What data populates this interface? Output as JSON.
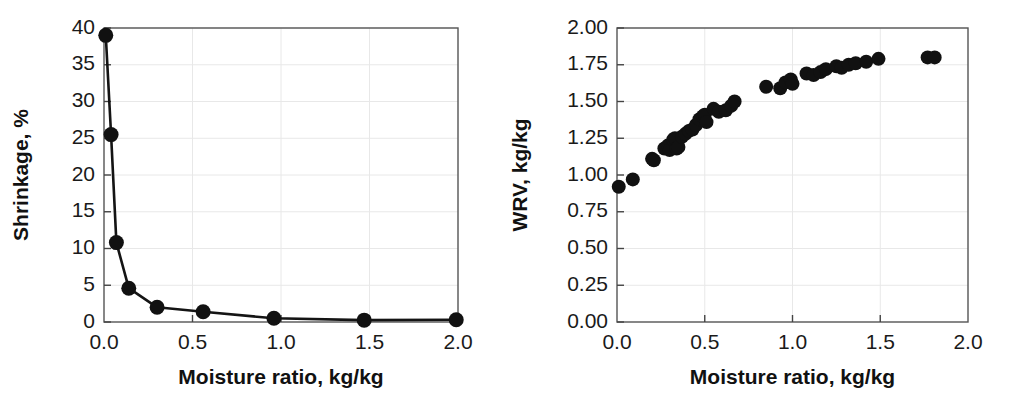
{
  "figure": {
    "panels": [
      "shrinkage-panel",
      "wrv-panel"
    ],
    "background": "#ffffff",
    "marker_color": "#111111",
    "line_color": "#141414",
    "grid_color": "#e8e8e8",
    "frame_color": "#555555"
  },
  "chart_data": [
    {
      "id": "shrinkage-panel",
      "type": "line",
      "title": "",
      "xlabel": "Moisture ratio, kg/kg",
      "ylabel": "Shrinkage, %",
      "xlim": [
        0.0,
        2.0
      ],
      "ylim": [
        0,
        40
      ],
      "xticks": [
        0.0,
        0.5,
        1.0,
        1.5,
        2.0
      ],
      "xtick_labels": [
        "0.0",
        "0.5",
        "1.0",
        "1.5",
        "2.0"
      ],
      "yticks": [
        0,
        5,
        10,
        15,
        20,
        25,
        30,
        35,
        40
      ],
      "ytick_labels": [
        "0",
        "5",
        "10",
        "15",
        "20",
        "25",
        "30",
        "35",
        "40"
      ],
      "grid": true,
      "legend": "none",
      "markers": "filled-circle",
      "x": [
        0.01,
        0.04,
        0.07,
        0.14,
        0.3,
        0.56,
        0.96,
        1.47,
        1.99
      ],
      "y": [
        39.0,
        25.5,
        10.8,
        4.6,
        2.0,
        1.4,
        0.5,
        0.25,
        0.3
      ]
    },
    {
      "id": "wrv-panel",
      "type": "scatter",
      "title": "",
      "xlabel": "Moisture ratio, kg/kg",
      "ylabel": "WRV, kg/kg",
      "xlim": [
        0.0,
        2.0
      ],
      "ylim": [
        0.0,
        2.0
      ],
      "xticks": [
        0.0,
        0.5,
        1.0,
        1.5,
        2.0
      ],
      "xtick_labels": [
        "0.0",
        "0.5",
        "1.0",
        "1.5",
        "2.0"
      ],
      "yticks": [
        0.0,
        0.25,
        0.5,
        0.75,
        1.0,
        1.25,
        1.5,
        1.75,
        2.0
      ],
      "ytick_labels": [
        "0.00",
        "0.25",
        "0.50",
        "0.75",
        "1.00",
        "1.25",
        "1.50",
        "1.75",
        "2.00"
      ],
      "grid": true,
      "legend": "none",
      "markers": "filled-circle",
      "x": [
        0.01,
        0.09,
        0.2,
        0.21,
        0.27,
        0.29,
        0.3,
        0.32,
        0.33,
        0.34,
        0.35,
        0.37,
        0.39,
        0.41,
        0.43,
        0.45,
        0.47,
        0.49,
        0.5,
        0.51,
        0.55,
        0.58,
        0.62,
        0.65,
        0.67,
        0.85,
        0.93,
        0.96,
        0.99,
        1.0,
        1.08,
        1.12,
        1.16,
        1.19,
        1.25,
        1.28,
        1.32,
        1.36,
        1.42,
        1.49,
        1.77,
        1.81
      ],
      "y": [
        0.92,
        0.97,
        1.11,
        1.1,
        1.18,
        1.2,
        1.17,
        1.24,
        1.25,
        1.18,
        1.19,
        1.26,
        1.28,
        1.3,
        1.31,
        1.34,
        1.38,
        1.4,
        1.41,
        1.36,
        1.45,
        1.43,
        1.44,
        1.47,
        1.5,
        1.6,
        1.59,
        1.63,
        1.65,
        1.62,
        1.69,
        1.68,
        1.7,
        1.72,
        1.74,
        1.73,
        1.75,
        1.76,
        1.77,
        1.79,
        1.8,
        1.8
      ]
    }
  ]
}
